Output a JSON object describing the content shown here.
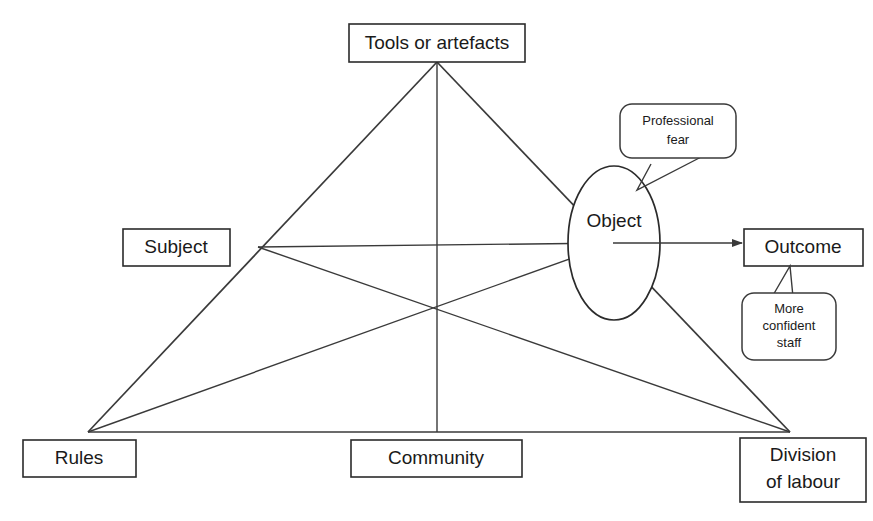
{
  "diagram": {
    "background_color": "#ffffff",
    "line_color": "#3a3a3a",
    "text_color": "#1a1a1a",
    "nodes": {
      "tools": {
        "label": "Tools or artefacts"
      },
      "subject": {
        "label": "Subject"
      },
      "object": {
        "label": "Object"
      },
      "outcome": {
        "label": "Outcome"
      },
      "rules": {
        "label": "Rules"
      },
      "community": {
        "label": "Community"
      },
      "division": {
        "label_line1": "Division",
        "label_line2": "of labour"
      }
    },
    "callouts": {
      "professional_fear": {
        "line1": "Professional",
        "line2": "fear",
        "points_to": "object"
      },
      "more_confident_staff": {
        "line1": "More",
        "line2": "confident",
        "line3": "staff",
        "points_to": "outcome"
      }
    },
    "arrows": {
      "object_to_outcome": "Object to Outcome"
    }
  }
}
